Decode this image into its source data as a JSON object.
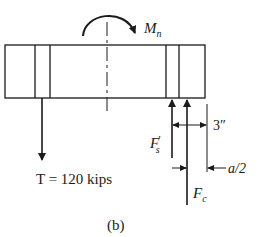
{
  "figure": {
    "caption": "(b)",
    "moment_label": "M",
    "moment_sub": "n",
    "tension_label": "T = 120 kips",
    "steel_force_label": "F",
    "steel_force_prime": "′",
    "steel_force_sub": "s",
    "concrete_force_label": "F",
    "concrete_force_sub": "c",
    "dimension_3in": "3″",
    "dimension_a_half": "a/2"
  },
  "colors": {
    "ink": "#1a1a1a",
    "background": "#ffffff"
  }
}
